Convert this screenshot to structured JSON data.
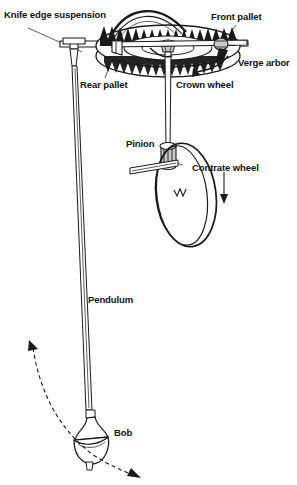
{
  "figure": {
    "width": 297,
    "height": 485,
    "background_color": "#ffffff",
    "ink_color": "#1a1a1a",
    "shade_color": "#c9c9c9"
  },
  "labels": {
    "knife_edge_suspension": "Knife edge suspension",
    "front_pallet": "Front pallet",
    "verge_arbor": "Verge arbor",
    "rear_pallet": "Rear pallet",
    "crown_wheel": "Crown wheel",
    "pinion": "Pinion",
    "contrate_wheel": "Contrate wheel",
    "pendulum": "Pendulum",
    "bob": "Bob"
  },
  "annotations": {
    "crown_wheel_rotation_arrow": "curved-arrow-clockwise",
    "contrate_wheel_rotation_arrow": "down-arrow",
    "pendulum_swing_arrow_left": "arrow-up-left",
    "pendulum_swing_arrow_right": "arrow-down-right",
    "swing_arc": "dashed-arc"
  },
  "parts": {
    "crown_wheel_teeth_count": 22,
    "contrate_wheel_teeth_marker": "sawtooth-rim",
    "pendulum_rod": "vertical-two-line-rod",
    "bob_shape": "bell-and-hemisphere"
  }
}
